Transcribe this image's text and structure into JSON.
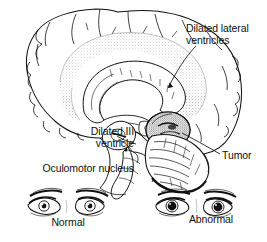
{
  "figure": {
    "background_color": "#ffffff",
    "ink_color": "#111111"
  },
  "labels": {
    "lateral_ventricles": "Dilated lateral\nventricles",
    "lateral_ventricles_line1": "Dilated lateral",
    "lateral_ventricles_line2": "ventricles",
    "third_ventricle_line1": "Dilated III",
    "third_ventricle_line2": "ventricle",
    "oculomotor_nucleus": "Oculomotor nucleus",
    "tumor": "Tumor",
    "normal": "Normal",
    "abnormal": "Abnormal"
  },
  "structures": [
    {
      "name": "cerebral-cortex",
      "description": "outer cortical ribbon with gyri and sulci"
    },
    {
      "name": "dilated-lateral-ventricle",
      "description": "stippled enlarged ventricle band"
    },
    {
      "name": "corpus-callosum",
      "description": "arched white matter commissure"
    },
    {
      "name": "dilated-third-ventricle",
      "description": "enlarged midline ventricle"
    },
    {
      "name": "oculomotor-nucleus",
      "description": "midbrain nucleus"
    },
    {
      "name": "tumor-mass",
      "description": "dark stippled rounded mass at tentorial region"
    },
    {
      "name": "cerebellum",
      "description": "foliated structure posterior inferior"
    },
    {
      "name": "brainstem",
      "description": "midbrain pons medulla"
    }
  ],
  "eyes": {
    "normal": {
      "caption": "Normal",
      "pupil_state": "constricted",
      "lid_state": "open"
    },
    "abnormal": {
      "caption": "Abnormal",
      "pupil_state": "dilated",
      "lid_state": "ptosis"
    }
  }
}
